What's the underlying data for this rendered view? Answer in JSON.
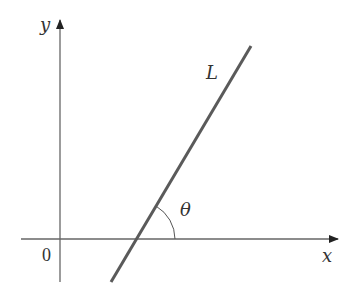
{
  "diagram": {
    "labels": {
      "y_axis": "y",
      "x_axis": "x",
      "origin": "0",
      "line": "L",
      "angle": "θ"
    },
    "colors": {
      "axis": "#555555",
      "line": "#5a5a5a",
      "text": "#333333"
    }
  }
}
